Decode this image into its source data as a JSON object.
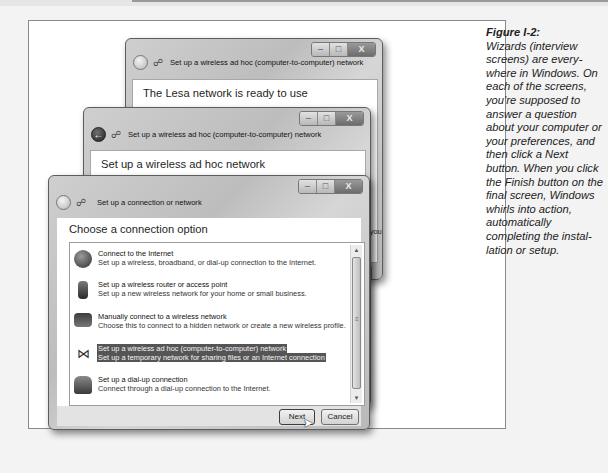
{
  "caption": {
    "figure_label": "Figure I-2:",
    "text": "Wizards (interview screens) are every-where in Windows. On each of the screens, you're supposed to answer a question about your computer or your preferences, and then click a Next button. When you click the Finish button on the final screen, Windows whirls into action, automatically completing the instal-lation or setup."
  },
  "windows": {
    "back": {
      "title": "Set up a wireless ad hoc (computer-to-computer) network",
      "heading": "The Lesa network is ready to use",
      "fragments": [
        "yone",
        "want",
        "aring.",
        "when you"
      ],
      "button_fragment": "ose",
      "controls": {
        "minimize": "–",
        "maximize": "□",
        "close": "X"
      }
    },
    "middle": {
      "title": "Set up a wireless ad hoc (computer-to-computer) network",
      "heading": "Set up a wireless ad hoc network",
      "fragments": [
        "nporary",
        "ultiple",
        "hen you"
      ],
      "button_fragment": "Cancel",
      "controls": {
        "minimize": "–",
        "maximize": "□",
        "close": "X"
      }
    },
    "front": {
      "title": "Set up a connection or network",
      "heading": "Choose a connection option",
      "controls": {
        "minimize": "–",
        "maximize": "□",
        "close": "X"
      },
      "options": [
        {
          "title": "Connect to the Internet",
          "desc": "Set up a wireless, broadband, or dial-up connection to the Internet.",
          "icon": "globe-icon",
          "selected": false
        },
        {
          "title": "Set up a wireless router or access point",
          "desc": "Set up a new wireless network for your home or small business.",
          "icon": "router-icon",
          "selected": false
        },
        {
          "title": "Manually connect to a wireless network",
          "desc": "Choose this to connect to a hidden network or create a new wireless profile.",
          "icon": "computer-icon",
          "selected": false
        },
        {
          "title": "Set up a wireless ad hoc (computer-to-computer) network",
          "desc": "Set up a temporary network for sharing files or an Internet connection",
          "icon": "adhoc-network-icon",
          "selected": true
        },
        {
          "title": "Set up a dial-up connection",
          "desc": "Connect through a dial-up connection to the Internet.",
          "icon": "phone-icon",
          "selected": false
        }
      ],
      "buttons": {
        "next": "Next",
        "cancel": "Cancel"
      }
    }
  },
  "colors": {
    "selection": "#555555",
    "page_bg": "#f3f3f3",
    "frame_border": "#8a8a8a"
  }
}
